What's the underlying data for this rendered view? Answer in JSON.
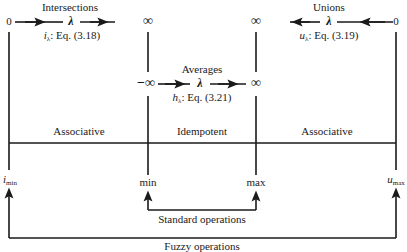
{
  "diagram": {
    "intersections": {
      "title": "Intersections",
      "start": "0",
      "param": "λ",
      "end": "∞",
      "func_symbol": "i",
      "func_sub": "λ",
      "equation": ": Eq. (3.18)"
    },
    "unions": {
      "title": "Unions",
      "start": "0",
      "param": "λ",
      "end": "∞",
      "func_symbol": "u",
      "func_sub": "λ",
      "equation": ": Eq. (3.19)"
    },
    "averages": {
      "title": "Averages",
      "start": "−∞",
      "param": "λ",
      "end": "∞",
      "func_symbol": "h",
      "func_sub": "λ",
      "equation": ": Eq. (3.21)"
    },
    "regions": [
      "Associative",
      "Idempotent",
      "Associative"
    ],
    "axis_labels": {
      "i_min_symbol": "i",
      "i_min_sub": "min",
      "min": "min",
      "max": "max",
      "u_max_symbol": "u",
      "u_max_sub": "max"
    },
    "brackets": {
      "standard": "Standard operations",
      "outer": "Fuzzy operations"
    },
    "colors": {
      "line": "#1a1a1a",
      "background": "#ffffff"
    }
  }
}
